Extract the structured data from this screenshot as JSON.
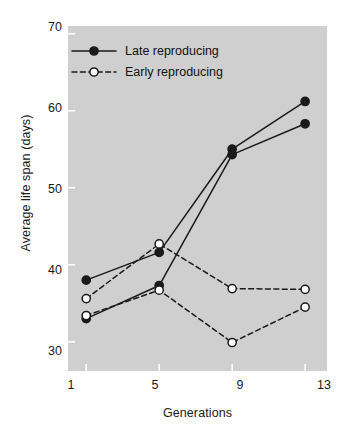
{
  "chart_data": {
    "type": "line",
    "title": "",
    "xlabel": "Generations",
    "ylabel": "Average life span (days)",
    "x": [
      1,
      5,
      9,
      13
    ],
    "xtick_labels": [
      "1",
      "5",
      "9",
      "13"
    ],
    "ytick_labels": [
      "70",
      "60",
      "50",
      "40",
      "30"
    ],
    "yticks": [
      70,
      60,
      50,
      40,
      30
    ],
    "xlim": [
      0,
      14.2
    ],
    "ylim": [
      26.2,
      71.0
    ],
    "grid": false,
    "legend_position": "top-left",
    "plot_background": "#cfcfcf",
    "line_color": "#1a1a1a",
    "marker_fill_closed": "#1a1a1a",
    "marker_fill_open": "#ffffff",
    "series": [
      {
        "name": "Late reproducing",
        "style": "solid",
        "marker": "filled-circle",
        "replicate": "A",
        "values": [
          38.0,
          41.6,
          55.0,
          61.2
        ]
      },
      {
        "name": "Late reproducing",
        "style": "solid",
        "marker": "filled-circle",
        "replicate": "B",
        "values": [
          33.0,
          37.3,
          54.3,
          58.3
        ]
      },
      {
        "name": "Early reproducing",
        "style": "dashed",
        "marker": "open-circle",
        "replicate": "A",
        "values": [
          35.6,
          42.7,
          36.9,
          36.8
        ]
      },
      {
        "name": "Early reproducing",
        "style": "dashed",
        "marker": "open-circle",
        "replicate": "B",
        "values": [
          33.4,
          36.7,
          29.9,
          34.5
        ]
      }
    ],
    "legend": [
      {
        "label": "Late reproducing",
        "style": "solid",
        "marker": "filled-circle"
      },
      {
        "label": "Early reproducing",
        "style": "dashed",
        "marker": "open-circle"
      }
    ]
  }
}
